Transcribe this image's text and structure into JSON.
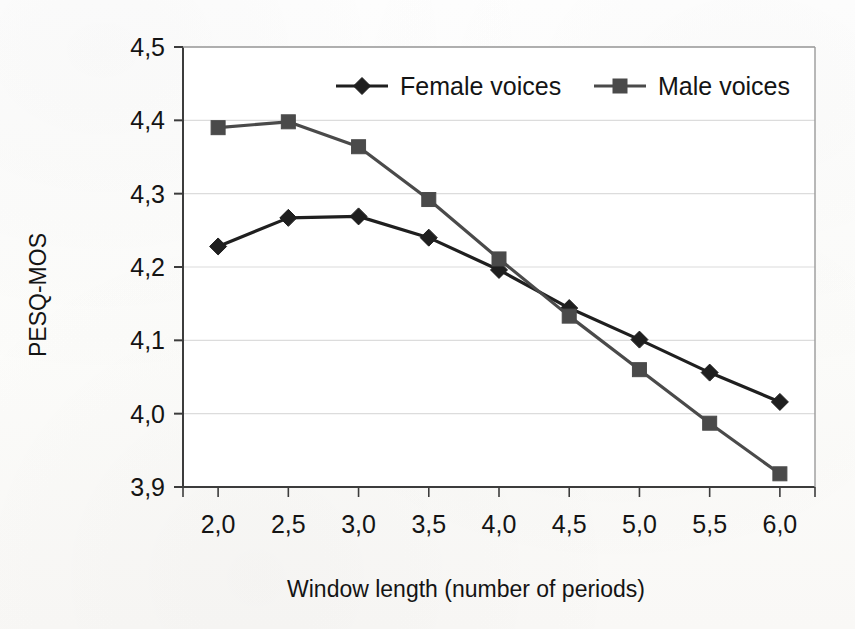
{
  "chart_data": {
    "type": "line",
    "title": "",
    "xlabel": "Window length (number of periods)",
    "ylabel": "PESQ-MOS",
    "x": [
      2.0,
      2.5,
      3.0,
      3.5,
      4.0,
      4.5,
      5.0,
      5.5,
      6.0
    ],
    "xticklabels": [
      "2,0",
      "2,5",
      "3,0",
      "3,5",
      "4,0",
      "4,5",
      "5,0",
      "5,5",
      "6,0"
    ],
    "yticks": [
      3.9,
      4.0,
      4.1,
      4.2,
      4.3,
      4.4,
      4.5
    ],
    "yticklabels": [
      "3,9",
      "4,0",
      "4,1",
      "4,2",
      "4,3",
      "4,4",
      "4,5"
    ],
    "xlim": [
      1.75,
      6.25
    ],
    "ylim": [
      3.9,
      4.5
    ],
    "grid": "horizontal",
    "legend_position": "top-center-inside",
    "decimal_separator": ",",
    "series": [
      {
        "name": "Female voices",
        "marker": "diamond",
        "color": "#1f1f1f",
        "values": [
          4.228,
          4.267,
          4.269,
          4.24,
          4.196,
          4.144,
          4.101,
          4.056,
          4.016
        ]
      },
      {
        "name": "Male voices",
        "marker": "square",
        "color": "#4a4a4a",
        "values": [
          4.39,
          4.398,
          4.364,
          4.292,
          4.211,
          4.133,
          4.06,
          3.987,
          3.918
        ]
      }
    ]
  },
  "legend": {
    "items": [
      {
        "label": "Female voices",
        "marker": "diamond"
      },
      {
        "label": "Male voices",
        "marker": "square"
      }
    ]
  },
  "axes": {
    "y_title": "PESQ-MOS",
    "x_title": "Window length (number of periods)"
  },
  "style": {
    "axis_color": "#3c3c3c",
    "grid_color": "#dcdcdc",
    "series_female_color": "#1f1f1f",
    "series_male_color": "#4a4a4a",
    "background": "#fdfdfc"
  }
}
